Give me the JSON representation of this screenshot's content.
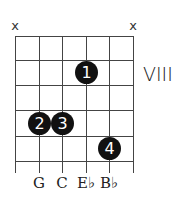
{
  "chord_diagram": {
    "position_label": "VIII",
    "muted_strings": [
      {
        "string": 6,
        "symbol": "x"
      },
      {
        "string": 1,
        "symbol": "x"
      }
    ],
    "fingers": [
      {
        "label": "1",
        "string": 3,
        "fret": 1
      },
      {
        "label": "2",
        "string": 5,
        "fret": 3
      },
      {
        "label": "3",
        "string": 4,
        "fret": 3
      },
      {
        "label": "4",
        "string": 2,
        "fret": 4
      }
    ],
    "notes": [
      "G",
      "C",
      "E♭",
      "B♭"
    ],
    "num_strings": 6,
    "num_frets": 5
  }
}
